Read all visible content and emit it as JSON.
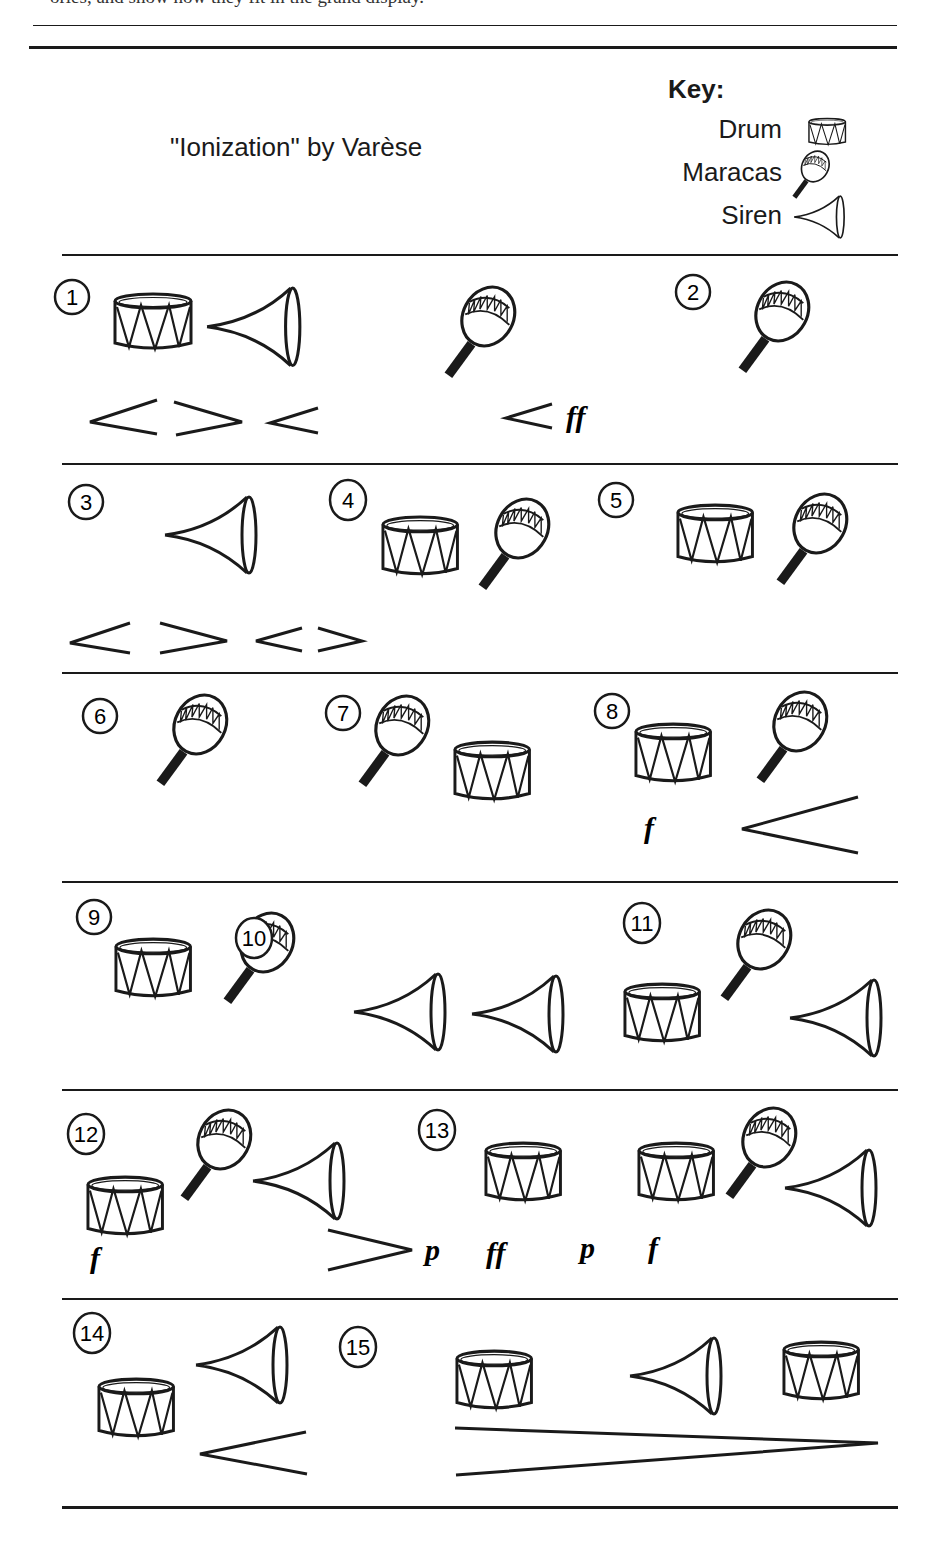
{
  "header": {
    "cut_off_text": "ories, and show how they fit in the grand display.",
    "title": "\"Ionization\" by Varèse"
  },
  "key": {
    "title": "Key:",
    "items": [
      {
        "label": "Drum",
        "icon": "drum-icon"
      },
      {
        "label": "Maracas",
        "icon": "maracas-icon"
      },
      {
        "label": "Siren",
        "icon": "siren-icon"
      }
    ]
  },
  "sections": [
    {
      "number": "1",
      "instruments": [
        "drum",
        "siren",
        "maracas"
      ],
      "dynamics": [
        "crescendo",
        "decrescendo",
        "crescendo",
        "crescendo",
        "ff"
      ]
    },
    {
      "number": "2",
      "instruments": [
        "maracas"
      ],
      "dynamics": []
    },
    {
      "number": "3",
      "instruments": [
        "siren"
      ],
      "dynamics": [
        "crescendo",
        "decrescendo",
        "crescendo",
        "decrescendo"
      ]
    },
    {
      "number": "4",
      "instruments": [
        "drum",
        "maracas"
      ],
      "dynamics": []
    },
    {
      "number": "5",
      "instruments": [
        "drum",
        "maracas"
      ],
      "dynamics": []
    },
    {
      "number": "6",
      "instruments": [
        "maracas"
      ],
      "dynamics": []
    },
    {
      "number": "7",
      "instruments": [
        "maracas",
        "drum"
      ],
      "dynamics": []
    },
    {
      "number": "8",
      "instruments": [
        "drum",
        "maracas"
      ],
      "dynamics": [
        "f",
        "crescendo"
      ]
    },
    {
      "number": "9",
      "instruments": [
        "drum",
        "maracas"
      ],
      "dynamics": []
    },
    {
      "number": "10",
      "instruments": [
        "siren",
        "siren"
      ],
      "dynamics": []
    },
    {
      "number": "11",
      "instruments": [
        "drum",
        "maracas",
        "siren"
      ],
      "dynamics": []
    },
    {
      "number": "12",
      "instruments": [
        "drum",
        "maracas",
        "siren"
      ],
      "dynamics": [
        "f",
        "decrescendo",
        "p"
      ]
    },
    {
      "number": "13",
      "instruments": [
        "drum",
        "drum",
        "maracas",
        "siren"
      ],
      "dynamics": [
        "ff",
        "p",
        "f"
      ]
    },
    {
      "number": "14",
      "instruments": [
        "drum",
        "siren"
      ],
      "dynamics": [
        "crescendo"
      ]
    },
    {
      "number": "15",
      "instruments": [
        "drum",
        "siren",
        "drum"
      ],
      "dynamics": [
        "decrescendo"
      ]
    }
  ],
  "dynamics_labels": {
    "ff": "ff",
    "f": "f",
    "p": "p"
  },
  "colors": {
    "ink": "#1a1a1a",
    "paper": "#ffffff"
  }
}
